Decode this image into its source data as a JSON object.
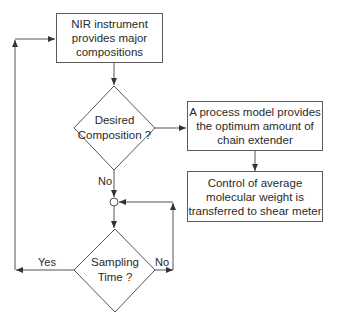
{
  "diagram": {
    "type": "flowchart",
    "nodes": {
      "nir": {
        "label": "NIR instrument\nprovides major\ncompositions",
        "shape": "rectangle"
      },
      "desired": {
        "label": "Desired\nComposition ?",
        "shape": "diamond"
      },
      "process_model": {
        "label": "A process model provides\nthe optimum amount of\nchain extender",
        "shape": "rectangle"
      },
      "control": {
        "label": "Control of average\nmolecular weight is\ntransferred to shear meter",
        "shape": "rectangle"
      },
      "junction": {
        "label": "",
        "shape": "circle"
      },
      "sampling": {
        "label": "Sampling\nTime ?",
        "shape": "diamond"
      }
    },
    "edges": [
      {
        "from": "nir",
        "to": "desired",
        "label": ""
      },
      {
        "from": "desired",
        "to": "process_model",
        "label": ""
      },
      {
        "from": "desired",
        "to": "junction",
        "label": "No"
      },
      {
        "from": "process_model",
        "to": "control",
        "label": ""
      },
      {
        "from": "junction",
        "to": "sampling",
        "label": ""
      },
      {
        "from": "sampling",
        "to": "nir",
        "label": "Yes"
      },
      {
        "from": "sampling",
        "to": "junction",
        "label": "No"
      }
    ],
    "labels": {
      "no_desired": "No",
      "yes_sampling": "Yes",
      "no_sampling": "No"
    },
    "colors": {
      "line": "#4a4a4a",
      "background": "#ffffff",
      "text": "#2a2a2a"
    }
  }
}
